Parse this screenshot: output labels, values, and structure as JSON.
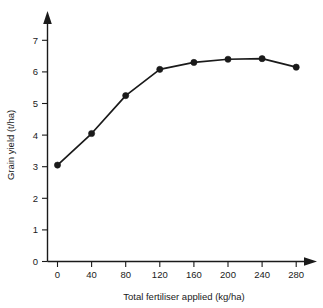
{
  "chart_data": {
    "type": "line",
    "title": "",
    "subtitle": "",
    "xlabel": "Total fertiliser applied (kg/ha)",
    "ylabel": "Grain yield (t/ha)",
    "x": [
      0,
      40,
      80,
      120,
      160,
      200,
      240,
      280
    ],
    "values": [
      3.05,
      4.05,
      5.25,
      6.08,
      6.3,
      6.4,
      6.42,
      6.15
    ],
    "series": [
      {
        "name": "Grain yield",
        "values": [
          3.05,
          4.05,
          5.25,
          6.08,
          6.3,
          6.4,
          6.42,
          6.15
        ]
      }
    ],
    "xtick_labels": [
      "0",
      "40",
      "80",
      "120",
      "160",
      "200",
      "240",
      "280"
    ],
    "ytick_labels": [
      "0",
      "1",
      "2",
      "3",
      "4",
      "5",
      "6",
      "7"
    ],
    "xticks": [
      0,
      40,
      80,
      120,
      160,
      200,
      240,
      280
    ],
    "yticks": [
      0,
      1,
      2,
      3,
      4,
      5,
      6,
      7
    ],
    "xlim": [
      0,
      280
    ],
    "ylim": [
      0,
      7
    ],
    "grid": false,
    "legend": false,
    "legend_position": "none",
    "marker": "filled-circle",
    "line_color": "#1a1a1a",
    "marker_color": "#1a1a1a",
    "background_color": "#ffffff",
    "axis_style": "arrow-tipped-open-axes",
    "annotations": []
  },
  "axes": {
    "x_axis_name": "x-axis",
    "y_axis_name": "y-axis"
  }
}
